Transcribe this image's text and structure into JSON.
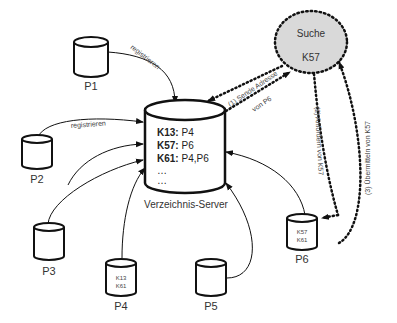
{
  "diagram": {
    "server": {
      "label": "Verzeichnis-Server",
      "entries": [
        {
          "key": "K13:",
          "value": " P4"
        },
        {
          "key": "K57:",
          "value": " P6"
        },
        {
          "key": "K61:",
          "value": " P4,P6"
        }
      ],
      "ellipsis1": "…",
      "ellipsis2": "…"
    },
    "search": {
      "title": "Suche",
      "key": "K57"
    },
    "peers": [
      {
        "id": "P1",
        "keys": []
      },
      {
        "id": "P2",
        "keys": []
      },
      {
        "id": "P3",
        "keys": []
      },
      {
        "id": "P4",
        "keys": [
          "K13",
          "K61"
        ]
      },
      {
        "id": "P5",
        "keys": []
      },
      {
        "id": "P6",
        "keys": [
          "K57",
          "K61"
        ]
      }
    ],
    "edges": {
      "p1_register": "registrieren",
      "p2_register": "registrieren",
      "step1_line1": "(1) Sende Adresse",
      "step1_line2": "von P6",
      "step2": "(2) Anfordern von K57",
      "step3": "(3) Übermitteln von K57"
    },
    "colors": {
      "search_fill": "#d9d9d9",
      "stroke": "#111111"
    }
  }
}
